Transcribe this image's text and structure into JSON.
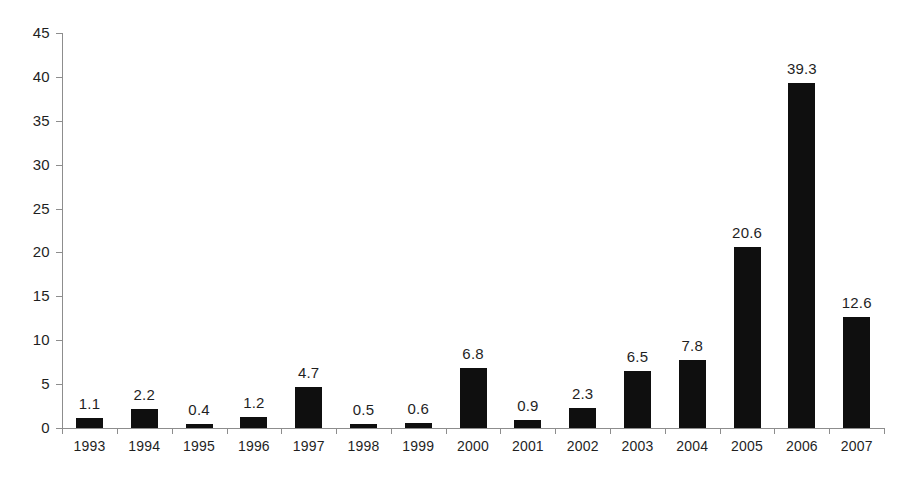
{
  "chart_data": {
    "type": "bar",
    "title": "",
    "subtitle": "",
    "xlabel": "",
    "ylabel": "",
    "categories": [
      "1993",
      "1994",
      "1995",
      "1996",
      "1997",
      "1998",
      "1999",
      "2000",
      "2001",
      "2002",
      "2003",
      "2004",
      "2005",
      "2006",
      "2007"
    ],
    "values": [
      1.1,
      2.2,
      0.4,
      1.2,
      4.7,
      0.5,
      0.6,
      6.8,
      0.9,
      2.3,
      6.5,
      7.8,
      20.6,
      39.3,
      12.6
    ],
    "value_labels": [
      "1.1",
      "2.2",
      "0.4",
      "1.2",
      "4.7",
      "0.5",
      "0.6",
      "6.8",
      "0.9",
      "2.3",
      "6.5",
      "7.8",
      "20.6",
      "39.3",
      "12.6"
    ],
    "ylim": [
      0,
      45
    ],
    "ytick_step": 5,
    "ytick_labels": [
      "0",
      "5",
      "10",
      "15",
      "20",
      "25",
      "30",
      "35",
      "40",
      "45"
    ],
    "ytick_values": [
      0,
      5,
      10,
      15,
      20,
      25,
      30,
      35,
      40,
      45
    ],
    "grid": false,
    "legend": null,
    "legend_position": "none",
    "bar_color": "#0f0f0f",
    "axis_color": "#8d8d8d",
    "text_color": "#1f1f1f",
    "background_color": "#ffffff",
    "data_labels_shown": true,
    "annotations": []
  }
}
